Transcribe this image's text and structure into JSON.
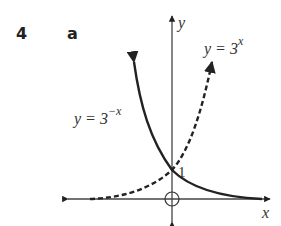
{
  "question": {
    "number": "4",
    "part": "a"
  },
  "axes": {
    "x_label": "x",
    "y_label": "y",
    "origin_marker": "circle-cross"
  },
  "curves": [
    {
      "name": "y = 3^x",
      "label_base": "y = 3",
      "label_exp": "x",
      "style": "dashed"
    },
    {
      "name": "y = 3^-x",
      "label_base": "y = 3",
      "label_exp": "−x",
      "style": "solid"
    }
  ],
  "annotations": {
    "y_intercept": "1"
  },
  "colors": {
    "curve": "#222222",
    "axis": "#444444",
    "background": "#ffffff"
  }
}
